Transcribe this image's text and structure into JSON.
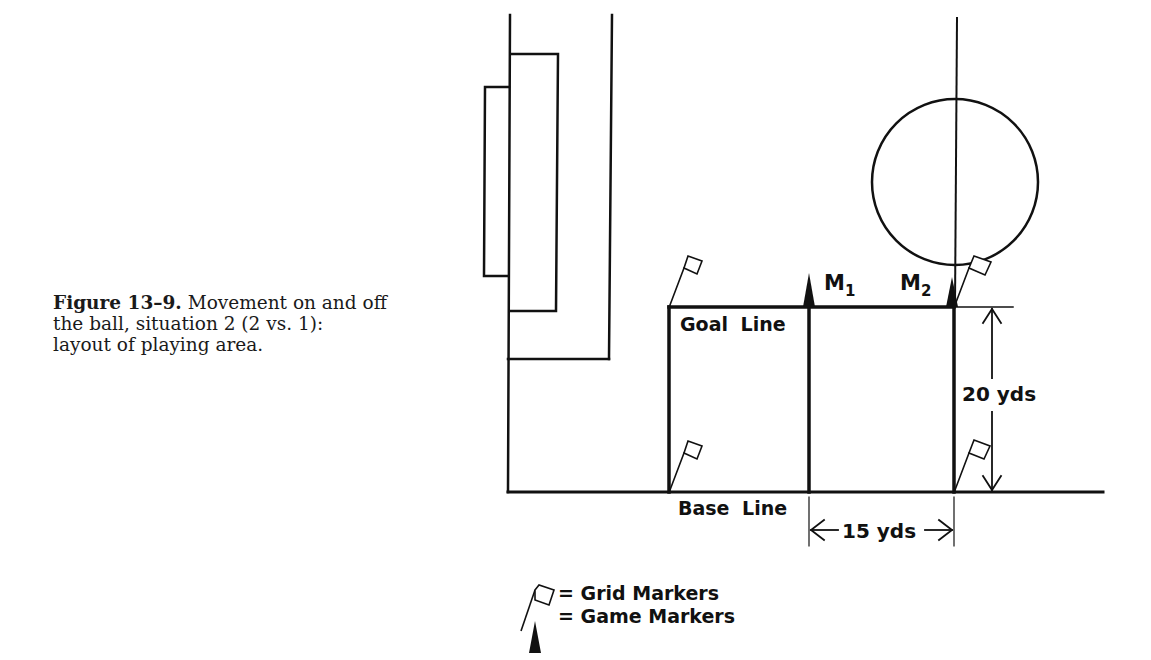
{
  "caption": {
    "figure_label": "Figure 13–9.",
    "lines": [
      " Movement on and off",
      "the ball, situation 2 (2 vs. 1):",
      "layout of playing area."
    ]
  },
  "diagram": {
    "goal_line_label": "Goal Line",
    "base_line_label": "Base Line",
    "marker_1_label": "M",
    "marker_1_sub": "1",
    "marker_2_label": "M",
    "marker_2_sub": "2",
    "width_dimension": "15 yds",
    "height_dimension": "20 yds",
    "stroke_color": "#111111"
  },
  "legend": {
    "items": [
      {
        "icon": "grid-marker-flag-icon",
        "label": "= Grid Markers"
      },
      {
        "icon": "game-marker-cone-icon",
        "label": "= Game Markers"
      }
    ]
  }
}
